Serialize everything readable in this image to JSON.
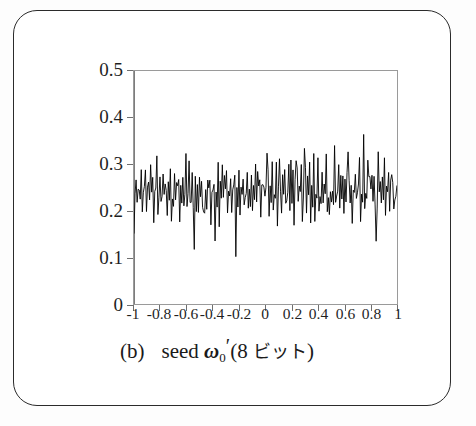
{
  "figure": {
    "panel_tag": "(b)",
    "caption_prefix": "seed",
    "caption_variable": "ω",
    "caption_variable_sub": "0",
    "caption_prime": "′",
    "caption_suffix_open": "(8",
    "caption_units": "ビット",
    "caption_suffix_close": ")",
    "full_caption": "(b)   seed ω₀′ (8 ビット)",
    "frame_color": "#2b2b2b",
    "background_color": "#ffffff",
    "trace_color": "#000000",
    "axis_color": "#9a9a9a"
  },
  "ylabel": {
    "symbol": "ρ",
    "symbol_sub": "64",
    "open_paren": "(",
    "arg0": "0",
    "comma1": ",",
    "arg1": "ω",
    "arg1_sub": "0",
    "comma2": ",",
    "arg2": "ω",
    "arg2_sub": "0",
    "arg2_prime": "′",
    "semicolon": ";",
    "arg3": "θ",
    "arg3_sub": "0",
    "comma3": ",",
    "arg4": "θ",
    "arg4_sub": "0.01",
    "close_paren": ")",
    "plain": "ρ₆₄(0,ω₀,ω₀′ ; θ₀,θ₀.₀₁)"
  },
  "chart_data": {
    "type": "line",
    "title": "",
    "subtitle": "",
    "xlabel": "seed ω₀′ (8 ビット)",
    "ylabel": "ρ₆₄(0,ω₀,ω₀′ ; θ₀,θ₀.₀₁)",
    "xlim": [
      -1,
      1
    ],
    "ylim": [
      0,
      0.5
    ],
    "xticks": [
      -1,
      -0.8,
      -0.6,
      -0.4,
      -0.2,
      0,
      0.2,
      0.4,
      0.6,
      0.8,
      1
    ],
    "xtick_labels": [
      "-1",
      "-0.8",
      "-0.6",
      "-0.4",
      "-0.2",
      "0",
      "0.2",
      "0.4",
      "0.6",
      "0.8",
      "1"
    ],
    "yticks": [
      0,
      0.1,
      0.2,
      0.3,
      0.4,
      0.5
    ],
    "ytick_labels": [
      "0",
      "0.1",
      "0.2",
      "0.3",
      "0.4",
      "0.5"
    ],
    "grid": false,
    "legend": null,
    "legend_position": "none",
    "series": [
      {
        "name": "rho_64",
        "mean": 0.243,
        "min": 0.11,
        "max": 0.362,
        "n_points": 256,
        "note": "dense noisy fluctuation about 0.24",
        "values": [
          0.178,
          0.232,
          0.259,
          0.205,
          0.266,
          0.223,
          0.248,
          0.287,
          0.214,
          0.252,
          0.231,
          0.275,
          0.196,
          0.241,
          0.268,
          0.209,
          0.287,
          0.236,
          0.254,
          0.187,
          0.262,
          0.229,
          0.293,
          0.211,
          0.247,
          0.274,
          0.198,
          0.239,
          0.281,
          0.216,
          0.257,
          0.234,
          0.203,
          0.269,
          0.243,
          0.288,
          0.192,
          0.251,
          0.226,
          0.276,
          0.208,
          0.261,
          0.237,
          0.295,
          0.182,
          0.249,
          0.222,
          0.271,
          0.206,
          0.258,
          0.344,
          0.213,
          0.246,
          0.283,
          0.194,
          0.24,
          0.265,
          0.218,
          0.129,
          0.253,
          0.228,
          0.279,
          0.201,
          0.262,
          0.236,
          0.291,
          0.186,
          0.244,
          0.221,
          0.273,
          0.207,
          0.256,
          0.233,
          0.286,
          0.199,
          0.248,
          0.225,
          0.268,
          0.141,
          0.259,
          0.231,
          0.297,
          0.19,
          0.242,
          0.219,
          0.277,
          0.204,
          0.254,
          0.238,
          0.289,
          0.195,
          0.247,
          0.223,
          0.272,
          0.209,
          0.26,
          0.235,
          0.284,
          0.112,
          0.245,
          0.22,
          0.266,
          0.202,
          0.251,
          0.23,
          0.293,
          0.188,
          0.243,
          0.217,
          0.27,
          0.206,
          0.257,
          0.232,
          0.281,
          0.197,
          0.249,
          0.224,
          0.307,
          0.211,
          0.263,
          0.239,
          0.296,
          0.193,
          0.246,
          0.222,
          0.274,
          0.208,
          0.255,
          0.301,
          0.287,
          0.2,
          0.252,
          0.227,
          0.32,
          0.212,
          0.261,
          0.237,
          0.29,
          0.191,
          0.244,
          0.332,
          0.269,
          0.205,
          0.258,
          0.234,
          0.313,
          0.198,
          0.25,
          0.226,
          0.276,
          0.21,
          0.264,
          0.24,
          0.298,
          0.189,
          0.245,
          0.328,
          0.271,
          0.203,
          0.253,
          0.229,
          0.285,
          0.196,
          0.248,
          0.321,
          0.267,
          0.207,
          0.259,
          0.236,
          0.292,
          0.187,
          0.241,
          0.218,
          0.33,
          0.204,
          0.256,
          0.233,
          0.288,
          0.199,
          0.247,
          0.148,
          0.273,
          0.209,
          0.262,
          0.238,
          0.333,
          0.192,
          0.243,
          0.221,
          0.268,
          0.205,
          0.254,
          0.231,
          0.318,
          0.194,
          0.249,
          0.225,
          0.277,
          0.211,
          0.26,
          0.237,
          0.294,
          0.186,
          0.246,
          0.223,
          0.27,
          0.327,
          0.257,
          0.232,
          0.283,
          0.201,
          0.251,
          0.228,
          0.275,
          0.208,
          0.263,
          0.239,
          0.299,
          0.19,
          0.244,
          0.22,
          0.362,
          0.206,
          0.255,
          0.23,
          0.286,
          0.197,
          0.25,
          0.227,
          0.272,
          0.213,
          0.265,
          0.241,
          0.147,
          0.195,
          0.242,
          0.219,
          0.269,
          0.204,
          0.258,
          0.235,
          0.289,
          0.2,
          0.247,
          0.224,
          0.274,
          0.21,
          0.261,
          0.28,
          0.236,
          0.193,
          0.245,
          0.222,
          0.266,
          0.258,
          0.231
        ]
      }
    ]
  }
}
